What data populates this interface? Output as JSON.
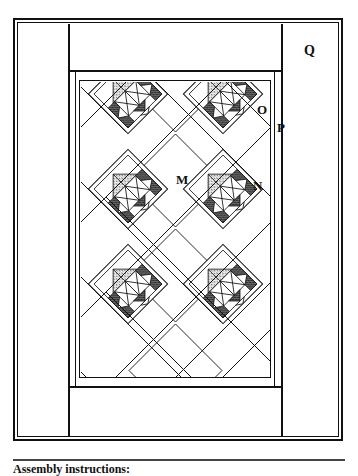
{
  "figure": {
    "caption": "Assembly instructions:",
    "labels": [
      {
        "id": "M",
        "text": "M",
        "meaning": "setting-square"
      },
      {
        "id": "N",
        "text": "N",
        "meaning": "setting-triangle"
      },
      {
        "id": "O",
        "text": "O",
        "meaning": "inner-border"
      },
      {
        "id": "P",
        "text": "P",
        "meaning": "middle-border"
      },
      {
        "id": "Q",
        "text": "Q",
        "meaning": "outer-border"
      }
    ],
    "colors": {
      "line": "#111111",
      "background": "#ffffff",
      "stipple_fill": "#9a9a9a",
      "dark_fill": "#3a3a3a"
    },
    "layout": {
      "block_columns": 2,
      "block_rows": 3,
      "block_count": 6,
      "set": "on-point"
    }
  }
}
